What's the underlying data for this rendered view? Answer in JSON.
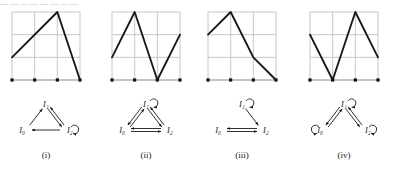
{
  "figure": {
    "kind": "mathematical-figure",
    "truncated_header_text": "—  —  —     —      —     —   —    —",
    "colors": {
      "grid": "#b9b9b9",
      "curve": "#1a1a1a",
      "axis": "#8c8c8c",
      "dot": "#111111",
      "text": "#1a1a1a",
      "background": "#ffffff"
    },
    "grid": {
      "cols": 3,
      "rows": 3,
      "x_ticks": [
        0,
        1,
        2,
        3
      ],
      "y_ticks": [
        0,
        1,
        2,
        3
      ]
    },
    "panels": [
      {
        "caption": "(i)",
        "chart": {
          "type": "line",
          "xlim": [
            0,
            3
          ],
          "ylim": [
            0,
            3
          ],
          "points": [
            [
              0,
              1
            ],
            [
              2,
              3
            ],
            [
              3,
              0
            ]
          ],
          "axis_dots": [
            [
              0,
              0
            ],
            [
              1,
              0
            ],
            [
              2,
              0
            ],
            [
              3,
              0
            ]
          ]
        },
        "diagram": {
          "nodes": [
            {
              "id": "I1",
              "label": "I₁",
              "position": "top"
            },
            {
              "id": "I0",
              "label": "I₀",
              "position": "bottom-left"
            },
            {
              "id": "I2",
              "label": "I₂",
              "position": "bottom-right"
            }
          ],
          "edges": [
            {
              "from": "I0",
              "to": "I1",
              "style": "single-arrow"
            },
            {
              "from": "I1",
              "to": "I2",
              "style": "double-arrow"
            },
            {
              "from": "I2",
              "to": "I0",
              "style": "single-arrow"
            }
          ],
          "self_loops": [
            "I2"
          ]
        }
      },
      {
        "caption": "(ii)",
        "chart": {
          "type": "line",
          "xlim": [
            0,
            3
          ],
          "ylim": [
            0,
            3
          ],
          "points": [
            [
              0,
              1
            ],
            [
              1,
              3
            ],
            [
              2,
              0
            ],
            [
              3,
              2
            ]
          ],
          "axis_dots": [
            [
              0,
              0
            ],
            [
              1,
              0
            ],
            [
              2,
              0
            ],
            [
              3,
              0
            ]
          ]
        },
        "diagram": {
          "nodes": [
            {
              "id": "I1",
              "label": "I₁",
              "position": "top"
            },
            {
              "id": "I0",
              "label": "I₀",
              "position": "bottom-left"
            },
            {
              "id": "I2",
              "label": "I₂",
              "position": "bottom-right"
            }
          ],
          "edges": [
            {
              "from": "I0",
              "to": "I1",
              "style": "double-arrow"
            },
            {
              "from": "I1",
              "to": "I2",
              "style": "double-arrow"
            },
            {
              "from": "I0",
              "to": "I2",
              "style": "double-arrow-horizontal"
            }
          ],
          "self_loops": [
            "I1"
          ]
        }
      },
      {
        "caption": "(iii)",
        "chart": {
          "type": "line",
          "xlim": [
            0,
            3
          ],
          "ylim": [
            0,
            3
          ],
          "points": [
            [
              0,
              2
            ],
            [
              1,
              3
            ],
            [
              2,
              1
            ],
            [
              3,
              0
            ]
          ],
          "axis_dots": [
            [
              0,
              0
            ],
            [
              1,
              0
            ],
            [
              2,
              0
            ],
            [
              3,
              0
            ]
          ]
        },
        "diagram": {
          "nodes": [
            {
              "id": "I1",
              "label": "I₁",
              "position": "top"
            },
            {
              "id": "I0",
              "label": "I₀",
              "position": "bottom-left"
            },
            {
              "id": "I2",
              "label": "I₂",
              "position": "bottom-right"
            }
          ],
          "edges": [
            {
              "from": "I1",
              "to": "I2",
              "style": "single-arrow"
            },
            {
              "from": "I0",
              "to": "I2",
              "style": "double-arrow-horizontal"
            }
          ],
          "self_loops": [
            "I1"
          ]
        }
      },
      {
        "caption": "(iv)",
        "chart": {
          "type": "line",
          "xlim": [
            0,
            3
          ],
          "ylim": [
            0,
            3
          ],
          "points": [
            [
              0,
              2
            ],
            [
              1,
              0
            ],
            [
              2,
              3
            ],
            [
              3,
              1
            ]
          ],
          "axis_dots": [
            [
              0,
              0
            ],
            [
              1,
              0
            ],
            [
              2,
              0
            ],
            [
              3,
              0
            ]
          ]
        },
        "diagram": {
          "nodes": [
            {
              "id": "I1",
              "label": "I₁",
              "position": "top"
            },
            {
              "id": "I0",
              "label": "I₀",
              "position": "bottom-left"
            },
            {
              "id": "I2",
              "label": "I₂",
              "position": "bottom-right"
            }
          ],
          "edges": [
            {
              "from": "I1",
              "to": "I0",
              "style": "double-arrow"
            },
            {
              "from": "I1",
              "to": "I2",
              "style": "double-arrow"
            }
          ],
          "self_loops": [
            "I1",
            "I0",
            "I2"
          ]
        }
      }
    ]
  }
}
